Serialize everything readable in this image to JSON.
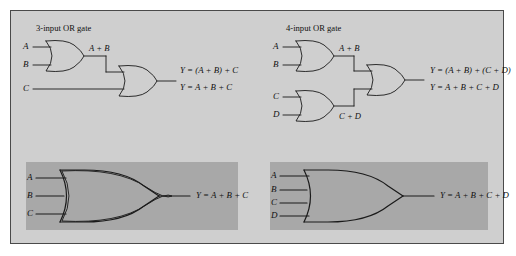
{
  "figure": {
    "background_color": "#cfcfcf",
    "panel_color": "#a8a8a8",
    "border_color": "#4a4a4a",
    "line_color": "#1a1a1a"
  },
  "panels": {
    "three_input": {
      "heading": "3-input OR gate",
      "inputs": [
        "A",
        "B",
        "C"
      ],
      "intermediate_label": "A + B",
      "equations": [
        "Y = (A + B) + C",
        "Y = A + B + C"
      ]
    },
    "four_input": {
      "heading": "4-input OR gate",
      "inputs": [
        "A",
        "B",
        "C",
        "D"
      ],
      "intermediate_labels": [
        "A + B",
        "C + D"
      ],
      "equations": [
        "Y = (A + B) + (C + D)",
        "Y = A + B + C + D"
      ]
    },
    "three_input_symbol": {
      "inputs": [
        "A",
        "B",
        "C"
      ],
      "output_equation": "Y = A + B + C"
    },
    "four_input_symbol": {
      "inputs": [
        "A",
        "B",
        "C",
        "D"
      ],
      "output_equation": "Y = A + B + C + D"
    }
  }
}
